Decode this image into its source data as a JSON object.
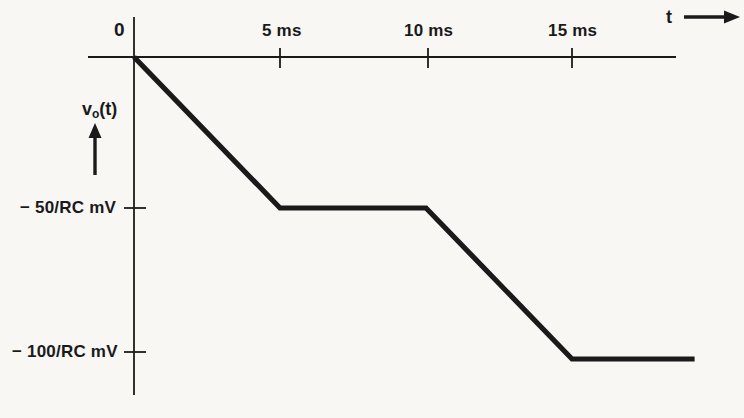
{
  "chart_data": {
    "type": "line",
    "title": "",
    "subtitle": "",
    "xlabel": "t",
    "ylabel": "v_o(t)",
    "xlim": [
      -2.0,
      20.0
    ],
    "ylim": [
      -130,
      18
    ],
    "grid": false,
    "legend": null,
    "x_unit": "ms",
    "y_unit": "mV",
    "x_tick_values": [
      0,
      5,
      10,
      15
    ],
    "x_tick_labels": [
      "0",
      "5 ms",
      "10 ms",
      "15 ms"
    ],
    "y_tick_values": [
      -50,
      -100
    ],
    "y_tick_labels": [
      "− 50/RC mV",
      "− 100/RC mV"
    ],
    "series": [
      {
        "name": "v_o(t)",
        "color": "#1a1a1a",
        "x": [
          0,
          5,
          10,
          15,
          19.2
        ],
        "y": [
          0,
          -50,
          -50,
          -100,
          -100
        ],
        "points": [
          {
            "t_ms": 0,
            "v": "0",
            "note": "origin, start of first ramp"
          },
          {
            "t_ms": 5,
            "v": "-50/RC mV",
            "note": "end of first ramp"
          },
          {
            "t_ms": 10,
            "v": "-50/RC mV",
            "note": "end of flat plateau"
          },
          {
            "t_ms": 15,
            "v": "-100/RC mV",
            "note": "end of second ramp"
          },
          {
            "t_ms": 19.2,
            "v": "-100/RC mV",
            "note": "end of trace"
          }
        ]
      }
    ],
    "annotations": [
      {
        "name": "t-axis-arrow",
        "label": "t",
        "direction": "right"
      },
      {
        "name": "v-axis-arrow",
        "label": "v_o(t)",
        "direction": "up"
      }
    ]
  },
  "axes": {
    "x_axis_label": "t",
    "y_axis_label_main": "v",
    "y_axis_label_sub": "o",
    "y_axis_label_tail": "(t)",
    "origin_label": "0",
    "x_ticks": [
      {
        "label": "5 ms"
      },
      {
        "label": "10 ms"
      },
      {
        "label": "15 ms"
      }
    ],
    "y_ticks": [
      {
        "label": "− 50/RC mV"
      },
      {
        "label": "− 100/RC mV"
      }
    ]
  },
  "colors": {
    "background": "#f8f7f4",
    "axis": "#1a1a1a",
    "trace": "#1a1a1a",
    "text": "#1a1a1a"
  }
}
